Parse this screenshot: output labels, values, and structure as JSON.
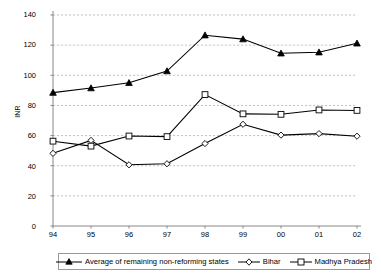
{
  "chart_data": {
    "type": "line",
    "title": "",
    "subtitle": "",
    "xlabel": "",
    "ylabel": "INR",
    "ylim": [
      0,
      140
    ],
    "ytick_step": 20,
    "yticks": [
      0,
      20,
      40,
      60,
      80,
      100,
      120,
      140
    ],
    "categories": [
      "94",
      "95",
      "96",
      "97",
      "98",
      "99",
      "00",
      "01",
      "02"
    ],
    "grid": "horizontal-dashed",
    "legend_position": "bottom",
    "series": [
      {
        "name": "Average of remaining non-reforming states",
        "marker": "filled-triangle",
        "color": "#000000",
        "values": [
          88.5,
          91.5,
          95.0,
          102.8,
          126.6,
          124.0,
          114.6,
          115.3,
          121.2
        ]
      },
      {
        "name": "Bihar",
        "marker": "open-diamond",
        "color": "#000000",
        "values": [
          48.2,
          56.8,
          40.6,
          41.3,
          54.7,
          67.5,
          60.3,
          61.3,
          59.6
        ]
      },
      {
        "name": "Madhya Pradesh",
        "marker": "open-square",
        "color": "#000000",
        "values": [
          56.3,
          53.0,
          59.7,
          59.3,
          87.2,
          74.4,
          74.1,
          77.0,
          76.7
        ]
      }
    ]
  },
  "axis": {
    "y_title": "INR",
    "y_tick_labels": [
      "140",
      "120",
      "100",
      "80",
      "60",
      "40",
      "20",
      "0"
    ],
    "x_tick_labels": [
      "94",
      "95",
      "96",
      "97",
      "98",
      "99",
      "00",
      "01",
      "02"
    ]
  },
  "legend": {
    "entries": [
      {
        "label": "Average of remaining non-reforming states",
        "icon": "filled-triangle-marker-icon"
      },
      {
        "label": "Bihar",
        "icon": "open-diamond-marker-icon"
      },
      {
        "label": "Madhya Pradesh",
        "icon": "open-square-marker-icon"
      }
    ]
  },
  "colors": {
    "line": "#000000",
    "grid": "#a8a8a8",
    "axis": "#7a7a7a",
    "background": "#ffffff"
  }
}
